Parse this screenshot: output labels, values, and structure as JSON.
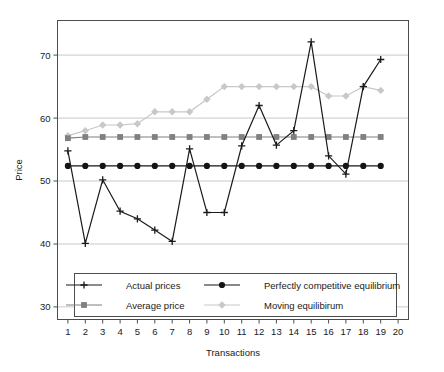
{
  "chart_data": {
    "type": "line",
    "title": "",
    "xlabel": "Transactions",
    "ylabel": "Price",
    "xlim": [
      0.4,
      20.6
    ],
    "ylim": [
      28,
      75.5
    ],
    "yticks": [
      30,
      40,
      50,
      60,
      70
    ],
    "xticks": [
      1,
      2,
      3,
      4,
      5,
      6,
      7,
      8,
      9,
      10,
      11,
      12,
      13,
      14,
      15,
      16,
      17,
      18,
      19,
      20
    ],
    "grid": "horizontal",
    "legend_position": "bottom-inside",
    "x": [
      1,
      2,
      3,
      4,
      5,
      6,
      7,
      8,
      9,
      10,
      11,
      12,
      13,
      14,
      15,
      16,
      17,
      18,
      19
    ],
    "series": [
      {
        "name": "Actual prices",
        "marker": "plus",
        "color": "#1a1a1a",
        "values": [
          54.8,
          40.1,
          50.2,
          45.2,
          44.0,
          42.2,
          40.4,
          55.1,
          45.0,
          45.0,
          55.6,
          62.0,
          55.7,
          58.0,
          72.1,
          54.0,
          51.1,
          65.0,
          69.3
        ]
      },
      {
        "name": "Average price",
        "marker": "square",
        "color": "#808080",
        "values": [
          56.8,
          57.0,
          57.0,
          57.0,
          57.0,
          57.0,
          57.0,
          57.0,
          57.0,
          57.0,
          57.0,
          57.0,
          57.0,
          57.0,
          57.0,
          57.0,
          57.0,
          57.0,
          57.0
        ]
      },
      {
        "name": "Perfectly competitive equilibrium",
        "marker": "circle",
        "color": "#141414",
        "values": [
          52.4,
          52.4,
          52.4,
          52.4,
          52.4,
          52.4,
          52.4,
          52.4,
          52.4,
          52.4,
          52.4,
          52.4,
          52.4,
          52.4,
          52.4,
          52.4,
          52.4,
          52.4,
          52.4
        ]
      },
      {
        "name": "Moving equilibirum",
        "marker": "diamond",
        "color": "#c8c8c8",
        "values": [
          57.2,
          58.0,
          58.9,
          58.9,
          59.1,
          61.0,
          61.0,
          61.0,
          63.0,
          65.0,
          65.0,
          65.0,
          65.0,
          65.0,
          65.0,
          63.5,
          63.5,
          65.0,
          64.4
        ]
      }
    ]
  },
  "axes": {
    "y_title": "Price",
    "x_title": "Transactions",
    "y_tick_labels": [
      "30",
      "40",
      "50",
      "60",
      "70"
    ],
    "x_tick_labels": [
      "1",
      "2",
      "3",
      "4",
      "5",
      "6",
      "7",
      "8",
      "9",
      "10",
      "11",
      "12",
      "13",
      "14",
      "15",
      "16",
      "17",
      "18",
      "19",
      "20"
    ]
  },
  "legend": {
    "entries": [
      {
        "label": "Actual prices",
        "marker": "plus",
        "color": "#1a1a1a"
      },
      {
        "label": "Perfectly competitive equilibrium",
        "marker": "circle",
        "color": "#141414"
      },
      {
        "label": "Average price",
        "marker": "square",
        "color": "#808080"
      },
      {
        "label": "Moving equilibirum",
        "marker": "diamond",
        "color": "#c8c8c8"
      }
    ]
  },
  "style": {
    "plot_border": "#4d4d4d",
    "gridline": "#c9c9c9",
    "background": "#ffffff"
  }
}
